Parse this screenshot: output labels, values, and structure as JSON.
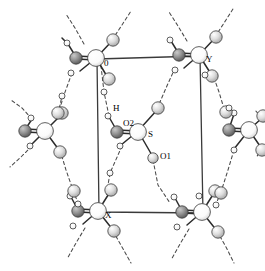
{
  "figure": {
    "background_color": "#ffffff",
    "width": 265,
    "height": 271
  },
  "unit_cell": {
    "name": "unit-cell-box",
    "stroke_color": "#3a3a3a",
    "corners": {
      "top_left": {
        "x": 97,
        "y": 59
      },
      "top_right": {
        "x": 200,
        "y": 56
      },
      "bottom_right": {
        "x": 203,
        "y": 213
      },
      "bottom_left": {
        "x": 99,
        "y": 212
      }
    },
    "axis_labels": [
      {
        "id": "origin",
        "text": "0",
        "x": 104,
        "y": 64
      },
      {
        "id": "y-axis",
        "text": "Y",
        "x": 206,
        "y": 60
      },
      {
        "id": "x-axis",
        "text": "X",
        "x": 105,
        "y": 216
      }
    ]
  },
  "atom_labels": [
    {
      "id": "label-h",
      "text": "H",
      "x": 113,
      "y": 109
    },
    {
      "id": "label-o2",
      "text": "O2",
      "x": 123,
      "y": 124
    },
    {
      "id": "label-s",
      "text": "S",
      "x": 148,
      "y": 135
    },
    {
      "id": "label-o1",
      "text": "O1",
      "x": 160,
      "y": 157
    }
  ],
  "colors": {
    "sulfur_fill_light": "#ffffff",
    "sulfur_fill_shade": "#d8d8d8",
    "oxygen_dark_fill": "#8c8c8c",
    "oxygen_dark_shade": "#5a5a5a",
    "oxygen_light_fill": "#e0e0e0",
    "oxygen_light_shade": "#a8a8a8",
    "hydrogen_fill": "#ffffff",
    "bond_stroke": "#2b2b2b",
    "hbond_stroke": "#4a4a4a",
    "cell_stroke": "#3a3a3a"
  },
  "legend": {
    "atom_types": [
      {
        "name": "sulfur",
        "display": "S",
        "style": "large-white-sphere"
      },
      {
        "name": "oxygen-double-bonded",
        "display": "O2",
        "style": "medium-dark-sphere"
      },
      {
        "name": "oxygen-hydroxyl",
        "display": "O1",
        "style": "medium-light-sphere"
      },
      {
        "name": "hydrogen",
        "display": "H",
        "style": "small-open-circle"
      }
    ],
    "bond_types": [
      {
        "name": "covalent-bond",
        "style": "solid-line"
      },
      {
        "name": "hydrogen-bond",
        "style": "dashed-line"
      }
    ]
  },
  "molecules": [
    {
      "id": "molecule-central",
      "s_center": {
        "x": 138,
        "y": 131
      }
    },
    {
      "id": "molecule-top-left",
      "s_center": {
        "x": 96,
        "y": 58
      }
    },
    {
      "id": "molecule-top-right",
      "s_center": {
        "x": 199,
        "y": 55
      }
    },
    {
      "id": "molecule-bottom-left",
      "s_center": {
        "x": 98,
        "y": 211
      }
    },
    {
      "id": "molecule-bottom-right",
      "s_center": {
        "x": 202,
        "y": 212
      }
    },
    {
      "id": "molecule-left-middle",
      "s_center": {
        "x": 45,
        "y": 132
      }
    },
    {
      "id": "molecule-right-middle",
      "s_center": {
        "x": 249,
        "y": 131
      }
    }
  ]
}
